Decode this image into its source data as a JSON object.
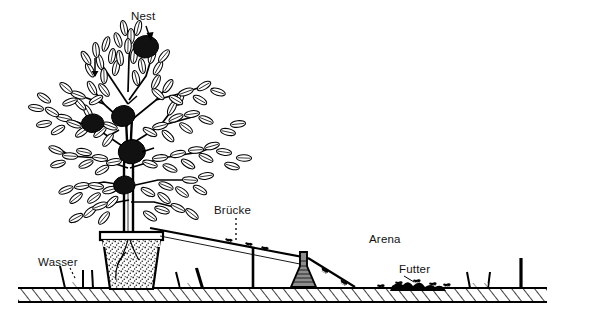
{
  "figure": {
    "kind": "line-drawing",
    "style": "black-and-white pen-and-ink scientific illustration",
    "background_color": "#ffffff",
    "ink_color": "#000000"
  },
  "labels": [
    {
      "id": "nest",
      "text": "Nest",
      "x": 131,
      "y": 11,
      "leader": "arrow-down-right"
    },
    {
      "id": "bruecke",
      "text": "Brücke",
      "x": 214,
      "y": 205,
      "leader": "dotted-down"
    },
    {
      "id": "arena",
      "text": "Arena",
      "x": 369,
      "y": 234,
      "leader": "none"
    },
    {
      "id": "futter",
      "text": "Futter",
      "x": 399,
      "y": 264,
      "leader": "thin-down-left"
    },
    {
      "id": "wasser",
      "text": "Wasser",
      "x": 38,
      "y": 257,
      "leader": "dotted-down-right"
    }
  ],
  "components": {
    "ground_band": {
      "x1": 18,
      "x2": 547,
      "top": 288,
      "bottom": 302,
      "hatch": "diagonal"
    },
    "pot": {
      "label": "plant pot with stippled soil",
      "left": 103,
      "right": 160,
      "top": 232,
      "bottom": 289
    },
    "tree": {
      "label": "leafy tree with nests",
      "canopy_top": 18,
      "trunk_x": 128
    },
    "bridge": {
      "label": "sloping bridge ramp",
      "from_x": 150,
      "from_y": 228,
      "to_x": 355,
      "to_y": 286
    },
    "flask": {
      "label": "erlenmeyer flask support",
      "x": 303,
      "y": 258
    },
    "post_right": {
      "label": "vertical post",
      "x": 521,
      "top": 258
    },
    "water_troughs": {
      "count": 4,
      "label": "water moat troughs"
    },
    "food_patch": {
      "label": "food items on arena floor",
      "x": 416,
      "y": 283
    }
  }
}
